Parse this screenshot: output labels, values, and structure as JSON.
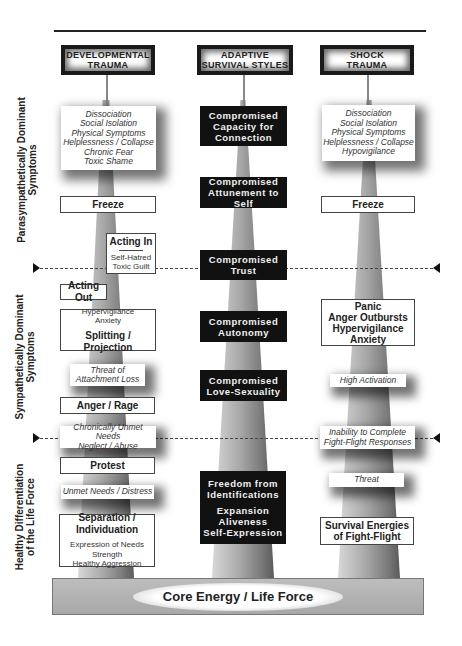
{
  "columns": {
    "developmental": {
      "title_line1": "Developmental",
      "title_line2": "Trauma"
    },
    "adaptive": {
      "title_line1": "Adaptive",
      "title_line2": "Survival Styles"
    },
    "shock": {
      "title_line1": "Shock",
      "title_line2": "Trauma"
    }
  },
  "side_labels": {
    "parasympathetic": {
      "line1": "Parasympathetically Dominant",
      "line2": "Symptoms"
    },
    "sympathetic": {
      "line1": "Sympathetically Dominant",
      "line2": "Symptoms"
    },
    "healthy": {
      "line1": "Healthy Differentiation",
      "line2": "of the Life Force"
    }
  },
  "developmental": {
    "symptoms": [
      "Dissociation",
      "Social Isolation",
      "Physical Symptoms",
      "Helplessness / Collapse",
      "Chronic Fear",
      "Toxic Shame"
    ],
    "freeze": "Freeze",
    "acting_in": {
      "title": "Acting In",
      "items": [
        "Self-Hatred",
        "Toxic Guilt"
      ]
    },
    "acting_out": "Acting Out",
    "splitting": {
      "items": [
        "Hypervigilance",
        "Anxiety"
      ],
      "title": "Splitting / Projection"
    },
    "threat": [
      "Threat of",
      "Attachment Loss"
    ],
    "anger": "Anger / Rage",
    "unmet_chronic": [
      "Chronically Unmet Needs",
      "Neglect / Abuse"
    ],
    "protest": "Protest",
    "unmet": "Unmet Needs / Distress",
    "separation": {
      "title": "Separation / Individuation",
      "items": [
        "Expression of Needs",
        "Strength",
        "Healthy Aggression"
      ]
    }
  },
  "adaptive": {
    "boxes": [
      [
        "Compromised",
        "Capacity for",
        "Connection"
      ],
      [
        "Compromised",
        "Attunement to Self"
      ],
      [
        "Compromised",
        "Trust"
      ],
      [
        "Compromised",
        "Autonomy"
      ],
      [
        "Compromised",
        "Love-Sexuality"
      ]
    ],
    "freedom": {
      "lines1": [
        "Freedom from",
        "Identifications"
      ],
      "lines2": [
        "Expansion",
        "Aliveness",
        "Self-Expression"
      ]
    }
  },
  "shock": {
    "symptoms": [
      "Dissociation",
      "Social Isolation",
      "Physical Symptoms",
      "Helplessness / Collapse",
      "Hypovigilance"
    ],
    "freeze": "Freeze",
    "panic": [
      "Panic",
      "Anger Outbursts",
      "Hypervigilance",
      "Anxiety"
    ],
    "high_activation": "High Activation",
    "inability": [
      "Inability to Complete",
      "Fight-Flight Responses"
    ],
    "threat": "Threat",
    "survival": [
      "Survival Energies",
      "of Fight-Flight"
    ]
  },
  "base": {
    "label": "Core Energy / Life Force"
  },
  "colors": {
    "black_box": "#111111",
    "pillar_light": "#d8d8d8",
    "pillar_dark": "#5a5a5a",
    "base": "#b3b3b3"
  }
}
